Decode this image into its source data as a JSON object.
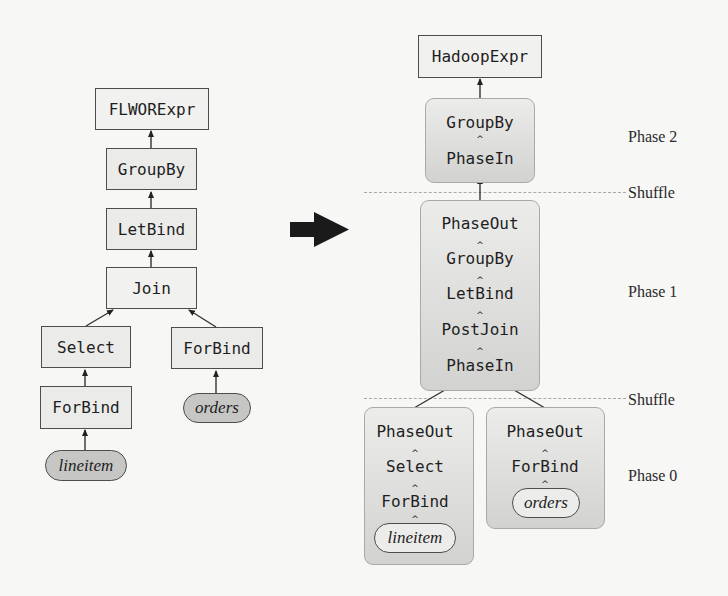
{
  "figure": {
    "left_tree": {
      "nodes": {
        "flwor": "FLWORExpr",
        "groupby": "GroupBy",
        "letbind": "LetBind",
        "join": "Join",
        "select": "Select",
        "forbind_right": "ForBind",
        "forbind_left": "ForBind",
        "source_lineitem": "lineitem",
        "source_orders": "orders"
      }
    },
    "transform_arrow": "right-arrow-icon",
    "right_tree": {
      "root": "HadoopExpr",
      "phase2": {
        "label": "Phase 2",
        "operators": [
          "GroupBy",
          "PhaseIn"
        ]
      },
      "phase1": {
        "label": "Phase 1",
        "operators": [
          "PhaseOut",
          "GroupBy",
          "LetBind",
          "PostJoin",
          "PhaseIn"
        ]
      },
      "phase0": {
        "label": "Phase 0",
        "left_branch": {
          "operators": [
            "PhaseOut",
            "Select",
            "ForBind"
          ],
          "source": "lineitem"
        },
        "right_branch": {
          "operators": [
            "PhaseOut",
            "ForBind"
          ],
          "source": "orders"
        }
      },
      "shuffle_labels": [
        "Shuffle",
        "Shuffle"
      ]
    },
    "colors": {
      "box_fill": "#ebebea",
      "box_border": "#4d4d4d",
      "pill_fill": "#c6c6c4",
      "group_top": "#ececeb",
      "group_bottom": "#d2d2d0",
      "dashed_line": "#a9a9a7",
      "text": "#1e1e1e"
    }
  }
}
